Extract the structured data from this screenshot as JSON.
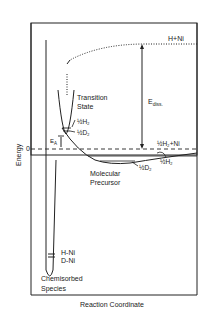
{
  "diagram": {
    "type": "potential-energy-diagram",
    "x_axis_label": "Reaction Coordinate",
    "y_axis_label": "Energy",
    "zero_label": "0",
    "labels": {
      "h_ni_asymptote": "H+Ni",
      "h2_ni_asymptote": "½H₂+Ni",
      "dissociation_energy_main": "E",
      "dissociation_energy_sub": "diss.",
      "activation_energy_main": "E",
      "activation_energy_sub": "A",
      "transition_state_line1": "Transition",
      "transition_state_line2": "State",
      "ts_h2": "½H₂",
      "ts_d2": "½D₂",
      "precursor_h2": "½H₂",
      "precursor_d2": "½D₂",
      "molecular_precursor_line1": "Molecular",
      "molecular_precursor_line2": "Precursor",
      "hni": "H-Ni",
      "dni": "D-Ni",
      "chemisorbed_line1": "Chemisorbed",
      "chemisorbed_line2": "Species"
    },
    "line_color": "#222222"
  }
}
